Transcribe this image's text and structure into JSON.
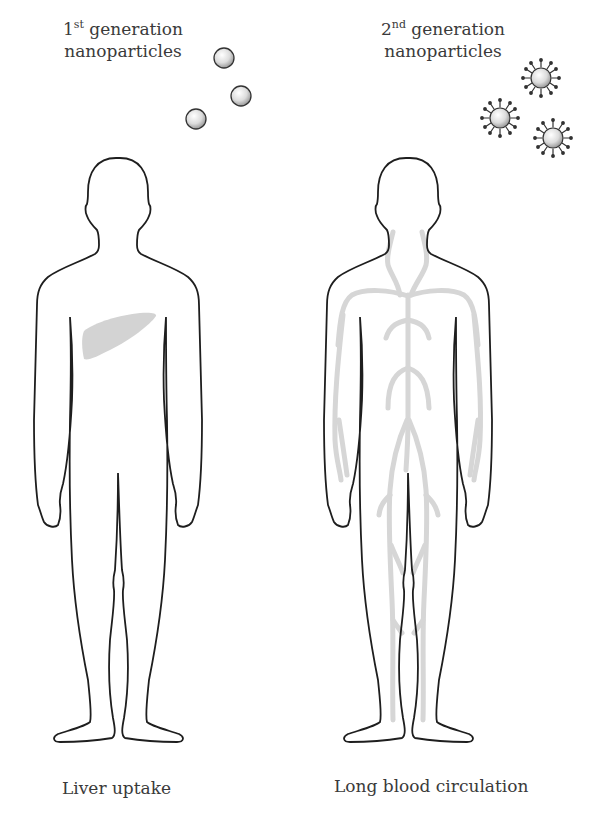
{
  "panels": [
    {
      "id": "first-generation",
      "heading": {
        "number": "1",
        "superscript": "st",
        "line1_rest": " generation",
        "line2": "nanoparticles"
      },
      "particle_type": "plain-sphere",
      "particle_count": 3,
      "highlighted_organ": "liver",
      "caption": "Liver uptake"
    },
    {
      "id": "second-generation",
      "heading": {
        "number": "2",
        "superscript": "nd",
        "line1_rest": " generation",
        "line2": "nanoparticles"
      },
      "particle_type": "coated-sphere-with-surface-ligands",
      "particle_count": 3,
      "highlighted_organ": "blood-vessels",
      "caption": "Long blood circulation"
    }
  ],
  "colors": {
    "outline": "#1e1e1e",
    "highlight_gray": "#d3d3d3",
    "text": "#3a3a3a",
    "background": "#ffffff"
  }
}
